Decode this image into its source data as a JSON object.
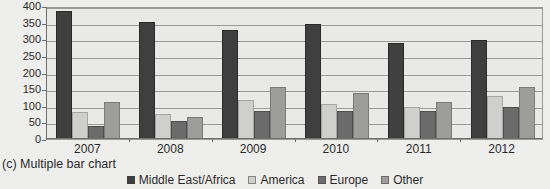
{
  "caption": "(c) Multiple bar chart",
  "colors": {
    "middle_east_africa": "#3f3f3f",
    "america": "#cfcfcd",
    "europe": "#6b6b6b",
    "other": "#9d9d9b",
    "plot_background": "#e9e9e7",
    "page_background": "#eeeeec",
    "gridline": "#9a9a98",
    "text": "#2b2b2b"
  },
  "legend": {
    "position": "bottom-center",
    "items": [
      {
        "label": "Middle East/Africa",
        "color": "#3f3f3f"
      },
      {
        "label": "America",
        "color": "#cfcfcd"
      },
      {
        "label": "Europe",
        "color": "#6b6b6b"
      },
      {
        "label": "Other",
        "color": "#9d9d9b"
      }
    ]
  },
  "chart_data": {
    "type": "bar",
    "title": "",
    "subtitle": "",
    "xlabel": "",
    "ylabel": "",
    "categories": [
      "2007",
      "2008",
      "2009",
      "2010",
      "2011",
      "2012"
    ],
    "series": [
      {
        "name": "Middle East/Africa",
        "color": "#3f3f3f",
        "values": [
          385,
          352,
          327,
          347,
          288,
          297
        ]
      },
      {
        "name": "America",
        "color": "#cfcfcd",
        "values": [
          80,
          75,
          118,
          105,
          97,
          130
        ]
      },
      {
        "name": "Europe",
        "color": "#6b6b6b",
        "values": [
          40,
          55,
          85,
          85,
          85,
          97
        ]
      },
      {
        "name": "Other",
        "color": "#9d9d9b",
        "values": [
          110,
          65,
          155,
          137,
          112,
          155
        ]
      }
    ],
    "ylim": [
      0,
      400
    ],
    "yticks": [
      0,
      50,
      100,
      150,
      200,
      250,
      300,
      350,
      400
    ],
    "ytick_labels": [
      "0",
      "50",
      "100",
      "150",
      "200",
      "250",
      "300",
      "350",
      "400"
    ],
    "grid": true,
    "grid_axis": "y",
    "legend_position": "bottom"
  }
}
